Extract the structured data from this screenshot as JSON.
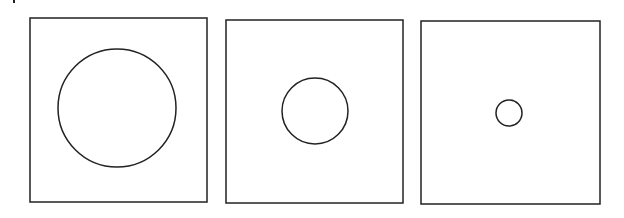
{
  "diagram": {
    "stroke_color": "#222222",
    "background": "#ffffff",
    "mark": {
      "x": 13,
      "y": 0,
      "width": 2,
      "height": 3
    },
    "panels": [
      {
        "id": "panel-1",
        "square": {
          "x": 30,
          "y": 18,
          "w": 177,
          "h": 184
        },
        "circle": {
          "cx": 117,
          "cy": 108,
          "r": 59
        }
      },
      {
        "id": "panel-2",
        "square": {
          "x": 226,
          "y": 20,
          "w": 177,
          "h": 183
        },
        "circle": {
          "cx": 315,
          "cy": 111,
          "r": 33
        }
      },
      {
        "id": "panel-3",
        "square": {
          "x": 421,
          "y": 21,
          "w": 179,
          "h": 183
        },
        "circle": {
          "cx": 509,
          "cy": 113,
          "r": 13
        }
      }
    ]
  }
}
